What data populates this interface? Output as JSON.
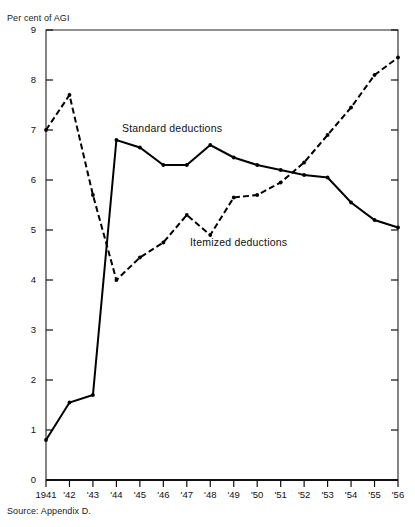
{
  "chart_data": {
    "type": "line",
    "title": "",
    "ylabel": "Per cent of AGI",
    "xlabel": "",
    "ylim": [
      0,
      9
    ],
    "ytick_values": [
      0,
      1,
      2,
      3,
      4,
      5,
      6,
      7,
      8,
      9
    ],
    "ytick_labels": [
      "0",
      "1",
      "2",
      "3",
      "4",
      "5",
      "6",
      "7",
      "8",
      "9"
    ],
    "categories": [
      "1941",
      "'42",
      "'43",
      "'44",
      "'45",
      "'46",
      "'47",
      "'48",
      "'49",
      "'50",
      "'51",
      "'52",
      "'53",
      "'54",
      "'55",
      "'56"
    ],
    "grid": false,
    "legend_position": "inline-annotation",
    "source_note": "Source: Appendix D.",
    "series": [
      {
        "name": "Standard deductions",
        "style": "solid",
        "color": "#000000",
        "label_text": "Standard deductions",
        "values": [
          0.8,
          1.55,
          1.7,
          6.8,
          6.65,
          6.3,
          6.3,
          6.7,
          6.45,
          6.3,
          6.2,
          6.1,
          6.05,
          5.55,
          5.2,
          5.05
        ]
      },
      {
        "name": "Itemized deductions",
        "style": "dashed",
        "color": "#000000",
        "label_text": "Itemized deductions",
        "values": [
          7.0,
          7.7,
          5.7,
          4.0,
          4.45,
          4.75,
          5.3,
          4.9,
          5.65,
          5.7,
          5.95,
          6.35,
          6.9,
          7.45,
          8.1,
          8.45
        ]
      }
    ],
    "annotations": [
      {
        "text": "Standard deductions",
        "x_px": 122,
        "y_px": 122
      },
      {
        "text": "Itemized deductions",
        "x_px": 190,
        "y_px": 236
      }
    ]
  }
}
